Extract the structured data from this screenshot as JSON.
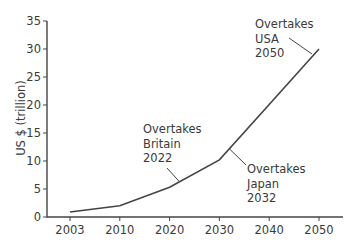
{
  "chart_data": {
    "type": "line",
    "title": "",
    "xlabel": "",
    "ylabel": "US $ (trillion)",
    "categories": [
      "2003",
      "2010",
      "2020",
      "2030",
      "2040",
      "2050"
    ],
    "values": [
      0.9,
      2.0,
      5.3,
      10.2,
      20.1,
      30.0
    ],
    "ylim": [
      0,
      35
    ],
    "yticks": [
      0,
      5,
      10,
      15,
      20,
      25,
      30,
      35
    ],
    "xticks": [
      "2003",
      "2010",
      "2020",
      "2030",
      "2040",
      "2050"
    ],
    "grid": false,
    "legend": null,
    "annotations": [
      {
        "lines": [
          "Overtakes",
          "Britain",
          "2022"
        ],
        "target_year": 2022
      },
      {
        "lines": [
          "Overtakes",
          "Japan",
          "2032"
        ],
        "target_year": 2032
      },
      {
        "lines": [
          "Overtakes",
          "USA",
          "2050"
        ],
        "target_year": 2050
      }
    ]
  },
  "colors": {
    "line": "#444444",
    "axis": "#444444",
    "text": "#3a3a3a"
  }
}
